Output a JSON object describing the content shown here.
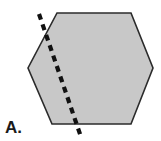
{
  "figure": {
    "label": "A.",
    "background_color": "#ffffff",
    "canvas": {
      "width": 161,
      "height": 141
    }
  },
  "shape": {
    "name": "hexagon",
    "fill_color": "#c8c8c8",
    "stroke_color": "#2b2b2b",
    "stroke_width": 1.6,
    "points": "57,13 131,13 153,68 131,124 52,124 28,68"
  },
  "cut_line": {
    "name": "dashed-cut-line",
    "color": "#111111",
    "width": 4.2,
    "dash_pattern": "6 5",
    "x1": 39,
    "y1": 14,
    "x2": 81,
    "y2": 137
  }
}
